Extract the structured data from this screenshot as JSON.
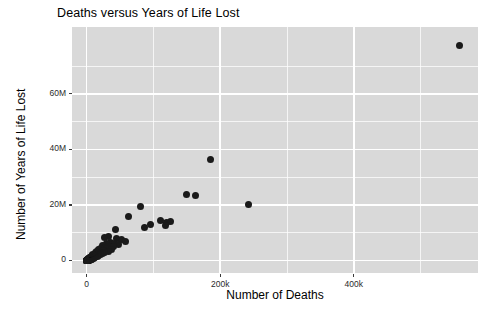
{
  "chart_data": {
    "type": "scatter",
    "title": "Deaths versus Years of Life Lost",
    "xlabel": "Number of Deaths",
    "ylabel": "Number of Years of Life Lost",
    "xlim": [
      -22000,
      586000
    ],
    "ylim": [
      -4500000,
      84000000
    ],
    "xticks": [
      0,
      200000,
      400000
    ],
    "xtick_labels": [
      "0",
      "200k",
      "400k"
    ],
    "yticks": [
      0,
      20000000,
      40000000,
      60000000
    ],
    "ytick_labels": [
      "0",
      "20M",
      "40M",
      "60M"
    ],
    "x_minor_ticks": [
      100000,
      300000,
      500000
    ],
    "y_minor_ticks": [
      10000000,
      30000000,
      50000000,
      70000000
    ],
    "grid": true,
    "legend": "none",
    "marker": "filled-circle",
    "marker_color": "#1a1a1a",
    "marker_size_px": 7,
    "panel_background": "#d9d9d9",
    "grid_color": "#ffffff",
    "points": [
      {
        "x": 558000,
        "y": 77200000
      },
      {
        "x": 186000,
        "y": 36400000
      },
      {
        "x": 150000,
        "y": 23600000
      },
      {
        "x": 163000,
        "y": 23300000
      },
      {
        "x": 242000,
        "y": 20200000
      },
      {
        "x": 80000,
        "y": 19300000
      },
      {
        "x": 63000,
        "y": 15700000
      },
      {
        "x": 110000,
        "y": 14500000
      },
      {
        "x": 120000,
        "y": 13600000
      },
      {
        "x": 126000,
        "y": 13900000
      },
      {
        "x": 118000,
        "y": 12700000
      },
      {
        "x": 96000,
        "y": 12900000
      },
      {
        "x": 87000,
        "y": 11800000
      },
      {
        "x": 43000,
        "y": 11200000
      },
      {
        "x": 33000,
        "y": 8600000
      },
      {
        "x": 27000,
        "y": 8200000
      },
      {
        "x": 44000,
        "y": 7900000
      },
      {
        "x": 52000,
        "y": 7400000
      },
      {
        "x": 58000,
        "y": 7000000
      },
      {
        "x": 36000,
        "y": 6600000
      },
      {
        "x": 30000,
        "y": 6200000
      },
      {
        "x": 41000,
        "y": 6000000
      },
      {
        "x": 47000,
        "y": 5700000
      },
      {
        "x": 24000,
        "y": 5400000
      },
      {
        "x": 34000,
        "y": 5100000
      },
      {
        "x": 40000,
        "y": 4900000
      },
      {
        "x": 28000,
        "y": 4700000
      },
      {
        "x": 21000,
        "y": 4400000
      },
      {
        "x": 31000,
        "y": 4200000
      },
      {
        "x": 37000,
        "y": 4000000
      },
      {
        "x": 18000,
        "y": 3800000
      },
      {
        "x": 25000,
        "y": 3600000
      },
      {
        "x": 32000,
        "y": 3400000
      },
      {
        "x": 15000,
        "y": 3200000
      },
      {
        "x": 22000,
        "y": 3000000
      },
      {
        "x": 27000,
        "y": 2900000
      },
      {
        "x": 13000,
        "y": 2700000
      },
      {
        "x": 19000,
        "y": 2600000
      },
      {
        "x": 24000,
        "y": 2400000
      },
      {
        "x": 11000,
        "y": 2300000
      },
      {
        "x": 16000,
        "y": 2200000
      },
      {
        "x": 20000,
        "y": 2100000
      },
      {
        "x": 9000,
        "y": 2000000
      },
      {
        "x": 14000,
        "y": 1900000
      },
      {
        "x": 17000,
        "y": 1800000
      },
      {
        "x": 8000,
        "y": 1700000
      },
      {
        "x": 12000,
        "y": 1650000
      },
      {
        "x": 15500,
        "y": 1550000
      },
      {
        "x": 7000,
        "y": 1450000
      },
      {
        "x": 10500,
        "y": 1400000
      },
      {
        "x": 13500,
        "y": 1300000
      },
      {
        "x": 6000,
        "y": 1250000
      },
      {
        "x": 9500,
        "y": 1200000
      },
      {
        "x": 12000,
        "y": 1150000
      },
      {
        "x": 5200,
        "y": 1050000
      },
      {
        "x": 8500,
        "y": 1000000
      },
      {
        "x": 11000,
        "y": 950000
      },
      {
        "x": 4500,
        "y": 900000
      },
      {
        "x": 7500,
        "y": 850000
      },
      {
        "x": 10000,
        "y": 820000
      },
      {
        "x": 3800,
        "y": 780000
      },
      {
        "x": 6500,
        "y": 740000
      },
      {
        "x": 9000,
        "y": 700000
      },
      {
        "x": 3200,
        "y": 660000
      },
      {
        "x": 5800,
        "y": 620000
      },
      {
        "x": 8200,
        "y": 590000
      },
      {
        "x": 2600,
        "y": 550000
      },
      {
        "x": 5000,
        "y": 520000
      },
      {
        "x": 7400,
        "y": 490000
      },
      {
        "x": 2100,
        "y": 460000
      },
      {
        "x": 4300,
        "y": 430000
      },
      {
        "x": 6600,
        "y": 400000
      },
      {
        "x": 1700,
        "y": 370000
      },
      {
        "x": 3600,
        "y": 350000
      },
      {
        "x": 5900,
        "y": 320000
      },
      {
        "x": 1300,
        "y": 300000
      },
      {
        "x": 3000,
        "y": 280000
      },
      {
        "x": 5200,
        "y": 260000
      },
      {
        "x": 1000,
        "y": 240000
      },
      {
        "x": 2500,
        "y": 220000
      },
      {
        "x": 4600,
        "y": 200000
      },
      {
        "x": 800,
        "y": 185000
      },
      {
        "x": 2000,
        "y": 170000
      },
      {
        "x": 4000,
        "y": 155000
      },
      {
        "x": 600,
        "y": 140000
      },
      {
        "x": 1600,
        "y": 128000
      },
      {
        "x": 3400,
        "y": 115000
      },
      {
        "x": 450,
        "y": 105000
      },
      {
        "x": 1250,
        "y": 95000
      },
      {
        "x": 2900,
        "y": 85000
      },
      {
        "x": 330,
        "y": 76000
      },
      {
        "x": 950,
        "y": 68000
      },
      {
        "x": 2400,
        "y": 60000
      },
      {
        "x": 240,
        "y": 53000
      },
      {
        "x": 700,
        "y": 46000
      },
      {
        "x": 1900,
        "y": 40000
      },
      {
        "x": 170,
        "y": 34000
      },
      {
        "x": 520,
        "y": 29000
      },
      {
        "x": 1450,
        "y": 24000
      },
      {
        "x": 110,
        "y": 20000
      },
      {
        "x": 380,
        "y": 16000
      },
      {
        "x": 1050,
        "y": 13000
      },
      {
        "x": 70,
        "y": 10000
      },
      {
        "x": 260,
        "y": 8000
      },
      {
        "x": 720,
        "y": 6000
      },
      {
        "x": 40,
        "y": 4500
      },
      {
        "x": 160,
        "y": 3200
      },
      {
        "x": 480,
        "y": 2200
      },
      {
        "x": 20,
        "y": 1500
      },
      {
        "x": 90,
        "y": 900
      },
      {
        "x": 300,
        "y": 500
      },
      {
        "x": 10,
        "y": 250
      },
      {
        "x": 50,
        "y": 120
      },
      {
        "x": 180,
        "y": 60
      }
    ]
  }
}
